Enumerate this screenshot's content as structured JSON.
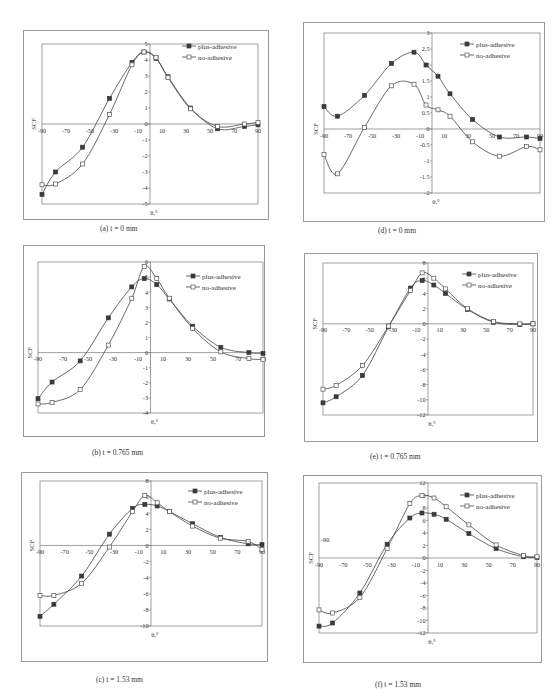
{
  "figure": {
    "legend_labels": [
      "plus-adhesive",
      "no-adhesive"
    ],
    "ylabel": "SCF",
    "xlabel": "θ,°"
  },
  "chart_data": [
    {
      "id": "a",
      "type": "line",
      "caption": "(a) t = 0 mm",
      "xlabel": "θ,°",
      "ylabel": "SCF",
      "xlim": [
        -90,
        90
      ],
      "ylim": [
        -5,
        5
      ],
      "xticks": [
        -90,
        -70,
        -50,
        -30,
        -10,
        10,
        30,
        50,
        70,
        90
      ],
      "yticks": [
        -5,
        -4,
        -3,
        -2,
        -1,
        0,
        1,
        2,
        3,
        4,
        5
      ],
      "ytick_labels": [
        "-5",
        "-4",
        "-3",
        "-2",
        "-1",
        "0",
        "1",
        "2",
        "3",
        "4",
        "5"
      ],
      "grid": false,
      "legend_position": "upper right",
      "x": [
        -90,
        -78.75,
        -56.25,
        -33.75,
        -15,
        -5,
        5,
        15,
        33.75,
        56.25,
        78.75,
        90
      ],
      "series": [
        {
          "name": "plus-adhesive",
          "marker": "filled-square",
          "values": [
            -4.4,
            -3.0,
            -1.45,
            1.6,
            3.85,
            4.5,
            4.1,
            2.95,
            1.0,
            -0.3,
            -0.15,
            -0.05
          ]
        },
        {
          "name": "no-adhesive",
          "marker": "open-square",
          "values": [
            -3.8,
            -3.75,
            -2.5,
            0.6,
            3.7,
            4.5,
            4.15,
            2.9,
            0.95,
            -0.15,
            0.0,
            0.1
          ]
        }
      ],
      "layout": {
        "frame": [
          23,
          30,
          246,
          190
        ],
        "plot": [
          42,
          44,
          216,
          160
        ],
        "legend": [
          182,
          46
        ]
      }
    },
    {
      "id": "d",
      "type": "line",
      "caption": "(d) t = 0 mm",
      "xlabel": "θ,°",
      "ylabel": "SCF",
      "xlim": [
        -90,
        90
      ],
      "ylim": [
        -2,
        3
      ],
      "xticks": [
        -90,
        -70,
        -50,
        -30,
        -10,
        10,
        30,
        50,
        70,
        90
      ],
      "yticks": [
        -2,
        -1.5,
        -1,
        -0.5,
        0,
        0.5,
        1,
        1.5,
        2,
        2.5,
        3
      ],
      "ytick_labels": [
        "-2",
        "-1.5",
        "-1",
        "-0.5",
        "0",
        "0.5",
        "1",
        "1.5",
        "2",
        "2.5",
        "3"
      ],
      "grid": false,
      "legend_position": "upper right",
      "x": [
        -90,
        -78.75,
        -56.25,
        -33.75,
        -15,
        -5,
        5,
        15,
        33.75,
        56.25,
        78.75,
        90
      ],
      "series": [
        {
          "name": "plus-adhesive",
          "marker": "filled-square",
          "values": [
            0.7,
            0.4,
            1.05,
            2.05,
            2.4,
            2.0,
            1.65,
            1.1,
            0.3,
            -0.25,
            -0.25,
            -0.3
          ]
        },
        {
          "name": "no-adhesive",
          "marker": "open-square",
          "values": [
            -0.8,
            -1.4,
            0.05,
            1.35,
            1.4,
            0.75,
            0.6,
            0.4,
            -0.4,
            -0.85,
            -0.55,
            -0.65
          ]
        }
      ],
      "layout": {
        "frame": [
          303,
          22,
          242,
          200
        ],
        "plot": [
          324,
          33,
          216,
          160
        ],
        "legend": [
          460,
          44
        ]
      }
    },
    {
      "id": "b",
      "type": "line",
      "caption": "(b) t = 0.765 mm",
      "xlabel": "θ,°",
      "ylabel": "SCF",
      "xlim": [
        -90,
        90
      ],
      "ylim": [
        -4,
        6
      ],
      "xticks": [
        -90,
        -70,
        -50,
        -30,
        -10,
        10,
        30,
        50,
        70,
        90
      ],
      "yticks": [
        -4,
        -3,
        -2,
        -1,
        0,
        1,
        2,
        3,
        4,
        5,
        6
      ],
      "ytick_labels": [
        "-4",
        "-3",
        "-2",
        "-1",
        "0",
        "1",
        "2",
        "3",
        "4",
        "5",
        "6"
      ],
      "grid": false,
      "legend_position": "upper right",
      "x": [
        -90,
        -78.75,
        -56.25,
        -33.75,
        -15,
        -5,
        5,
        15,
        33.75,
        56.25,
        78.75,
        90
      ],
      "series": [
        {
          "name": "plus-adhesive",
          "marker": "filled-square",
          "values": [
            -3.05,
            -1.95,
            -0.55,
            2.3,
            4.35,
            4.9,
            4.5,
            3.55,
            1.75,
            0.35,
            0.0,
            -0.05
          ]
        },
        {
          "name": "no-adhesive",
          "marker": "open-square",
          "values": [
            -3.4,
            -3.3,
            -2.45,
            0.5,
            3.6,
            5.7,
            4.9,
            3.6,
            1.6,
            0.05,
            -0.4,
            -0.45
          ]
        }
      ],
      "layout": {
        "frame": [
          23,
          245,
          242,
          192
        ],
        "plot": [
          38,
          262,
          225,
          151
        ],
        "legend": [
          186,
          276
        ]
      }
    },
    {
      "id": "e",
      "type": "line",
      "caption": "(e) t = 0.765 mm",
      "xlabel": "θ,°",
      "ylabel": "SCF",
      "xlim": [
        -90,
        90
      ],
      "ylim": [
        -12,
        8
      ],
      "xticks": [
        -90,
        -70,
        -50,
        -30,
        -10,
        10,
        30,
        50,
        70,
        90
      ],
      "yticks": [
        -12,
        -10,
        -8,
        -6,
        -4,
        -2,
        0,
        2,
        4,
        6,
        8
      ],
      "ytick_labels": [
        "-12",
        "-10",
        "-8",
        "-6",
        "-4",
        "-2",
        "0",
        "2",
        "4",
        "6",
        "8"
      ],
      "grid": false,
      "legend_position": "upper right",
      "x": [
        -90,
        -78.75,
        -56.25,
        -33.75,
        -15,
        -5,
        5,
        15,
        33.75,
        56.25,
        78.75,
        90
      ],
      "series": [
        {
          "name": "plus-adhesive",
          "marker": "filled-square",
          "values": [
            -10.4,
            -9.6,
            -6.8,
            -0.4,
            4.7,
            5.7,
            5.1,
            4.0,
            1.9,
            0.2,
            -0.1,
            0.0
          ]
        },
        {
          "name": "no-adhesive",
          "marker": "open-square",
          "values": [
            -8.6,
            -8.1,
            -5.5,
            -0.3,
            4.4,
            6.7,
            6.0,
            4.6,
            2.0,
            0.3,
            0.0,
            0.0
          ]
        }
      ],
      "layout": {
        "frame": [
          304,
          253,
          234,
          189
        ],
        "plot": [
          323,
          263,
          210,
          152
        ],
        "legend": [
          462,
          274
        ]
      }
    },
    {
      "id": "c",
      "type": "line",
      "caption": "(c) t = 1.53 mm",
      "xlabel": "θ,°",
      "ylabel": "SCF",
      "xlim": [
        -90,
        90
      ],
      "ylim": [
        -10,
        8
      ],
      "xticks": [
        -90,
        -70,
        -50,
        -30,
        -10,
        10,
        30,
        50,
        70,
        90
      ],
      "yticks": [
        -10,
        -8,
        -6,
        -4,
        -2,
        0,
        2,
        4,
        6,
        8
      ],
      "ytick_labels": [
        "-10",
        "-8",
        "-6",
        "-4",
        "-2",
        "0",
        "2",
        "4",
        "6",
        "8"
      ],
      "grid": false,
      "legend_position": "upper right",
      "x": [
        -90,
        -78.75,
        -56.25,
        -33.75,
        -15,
        -5,
        5,
        15,
        33.75,
        56.25,
        78.75,
        90
      ],
      "series": [
        {
          "name": "plus-adhesive",
          "marker": "filled-square",
          "values": [
            -8.8,
            -7.3,
            -3.8,
            1.4,
            4.6,
            5.1,
            4.9,
            4.2,
            2.7,
            1.0,
            0.2,
            0.1
          ]
        },
        {
          "name": "no-adhesive",
          "marker": "open-square",
          "values": [
            -6.2,
            -6.2,
            -4.7,
            -0.2,
            4.2,
            6.2,
            5.3,
            4.2,
            2.4,
            0.9,
            0.5,
            -0.5
          ]
        }
      ],
      "layout": {
        "frame": [
          21,
          472,
          247,
          190
        ],
        "plot": [
          40,
          481,
          222,
          145
        ],
        "legend": [
          188,
          491
        ]
      }
    },
    {
      "id": "f",
      "type": "line",
      "caption": "(f) t = 1.53 mm",
      "xlabel": "θ,°",
      "ylabel": "SCF",
      "xlim": [
        -90,
        90
      ],
      "ylim": [
        -12,
        12
      ],
      "xticks": [
        -90,
        -70,
        -50,
        -30,
        -10,
        10,
        30,
        50,
        70,
        90
      ],
      "yticks": [
        -12,
        -10,
        -8,
        -6,
        -4,
        -2,
        0,
        2,
        4,
        6,
        8,
        10,
        12
      ],
      "ytick_labels": [
        "-12",
        "-10",
        "-8",
        "-6",
        "-4",
        "-2",
        "0",
        "2",
        "4",
        "6",
        "8",
        "10",
        "12"
      ],
      "extra_label": "-90",
      "grid": false,
      "legend_position": "upper right",
      "x": [
        -90,
        -78.75,
        -56.25,
        -33.75,
        -15,
        -5,
        5,
        15,
        33.75,
        56.25,
        78.75,
        90
      ],
      "series": [
        {
          "name": "plus-adhesive",
          "marker": "filled-square",
          "values": [
            -10.9,
            -10.4,
            -5.6,
            2.2,
            6.4,
            7.2,
            7.0,
            6.2,
            3.9,
            1.5,
            0.2,
            0.1
          ]
        },
        {
          "name": "no-adhesive",
          "marker": "open-square",
          "values": [
            -8.3,
            -8.8,
            -6.3,
            1.5,
            8.7,
            10.0,
            9.6,
            8.2,
            5.3,
            2.1,
            0.4,
            0.2
          ]
        }
      ],
      "layout": {
        "frame": [
          303,
          475,
          239,
          188
        ],
        "plot": [
          319,
          483,
          218,
          150
        ],
        "legend": [
          460,
          495
        ]
      }
    }
  ]
}
